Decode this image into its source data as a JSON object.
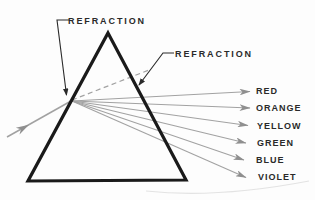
{
  "diagram": {
    "annotations": {
      "refraction_left": "REFRACTION",
      "refraction_right": "REFRACTION"
    },
    "spectrum": [
      "RED",
      "ORANGE",
      "YELLOW",
      "GREEN",
      "BLUE",
      "VIOLET"
    ],
    "palette": {
      "outline": "#1a1a1a",
      "ray": "#a2a2a2",
      "arrowhead": "#8f8f8f",
      "annotation": "#2a2a2a",
      "background": "#fdfdfd"
    }
  }
}
